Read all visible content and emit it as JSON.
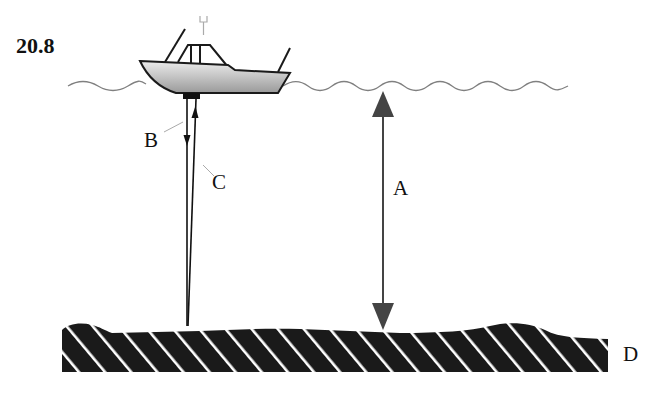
{
  "figure": {
    "number": "20.8",
    "labels": {
      "a": "A",
      "b": "B",
      "c": "C",
      "d": "D"
    },
    "elements": {
      "boat": "boat-with-sonar-transducer",
      "water_surface": "wavy-line",
      "seabed": "hatched-sea-floor",
      "depth_arrow": "double-headed-arrow",
      "outgoing_pulse": "downward-arrow",
      "returning_echo": "upward-arrow"
    },
    "colors": {
      "hull_fill_top": "#e6e6e6",
      "hull_fill_bottom": "#9a9a9a",
      "outline": "#1a1a1a",
      "water_line": "#808080",
      "seabed_fill": "#1a1a1a",
      "seabed_hatch": "#ffffff",
      "depth_arrow": "#444444"
    }
  }
}
